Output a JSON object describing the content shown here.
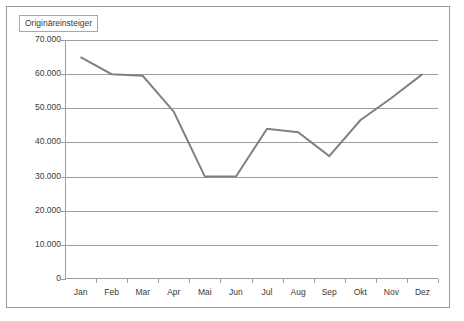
{
  "legend": {
    "label": "Originäreinsteiger"
  },
  "chart_data": {
    "type": "line",
    "title": "",
    "xlabel": "",
    "ylabel": "",
    "categories": [
      "Jan",
      "Feb",
      "Mar",
      "Apr",
      "Mai",
      "Jun",
      "Jul",
      "Aug",
      "Sep",
      "Okt",
      "Nov",
      "Dez"
    ],
    "series": [
      {
        "name": "Originäreinsteiger",
        "color": "#808080",
        "values": [
          65000,
          60000,
          59500,
          49000,
          30000,
          30000,
          44000,
          43000,
          36000,
          46500,
          53000,
          60000
        ]
      }
    ],
    "ylim": [
      0,
      70000
    ],
    "ytick_values": [
      70000,
      60000,
      50000,
      40000,
      30000,
      20000,
      10000,
      0
    ],
    "ytick_labels": [
      "70.000",
      "60.000",
      "50.000",
      "40.000",
      "30.000",
      "20.000",
      "10.000",
      "0"
    ],
    "grid": "horizontal",
    "legend_position": "top-left",
    "markers": false
  }
}
